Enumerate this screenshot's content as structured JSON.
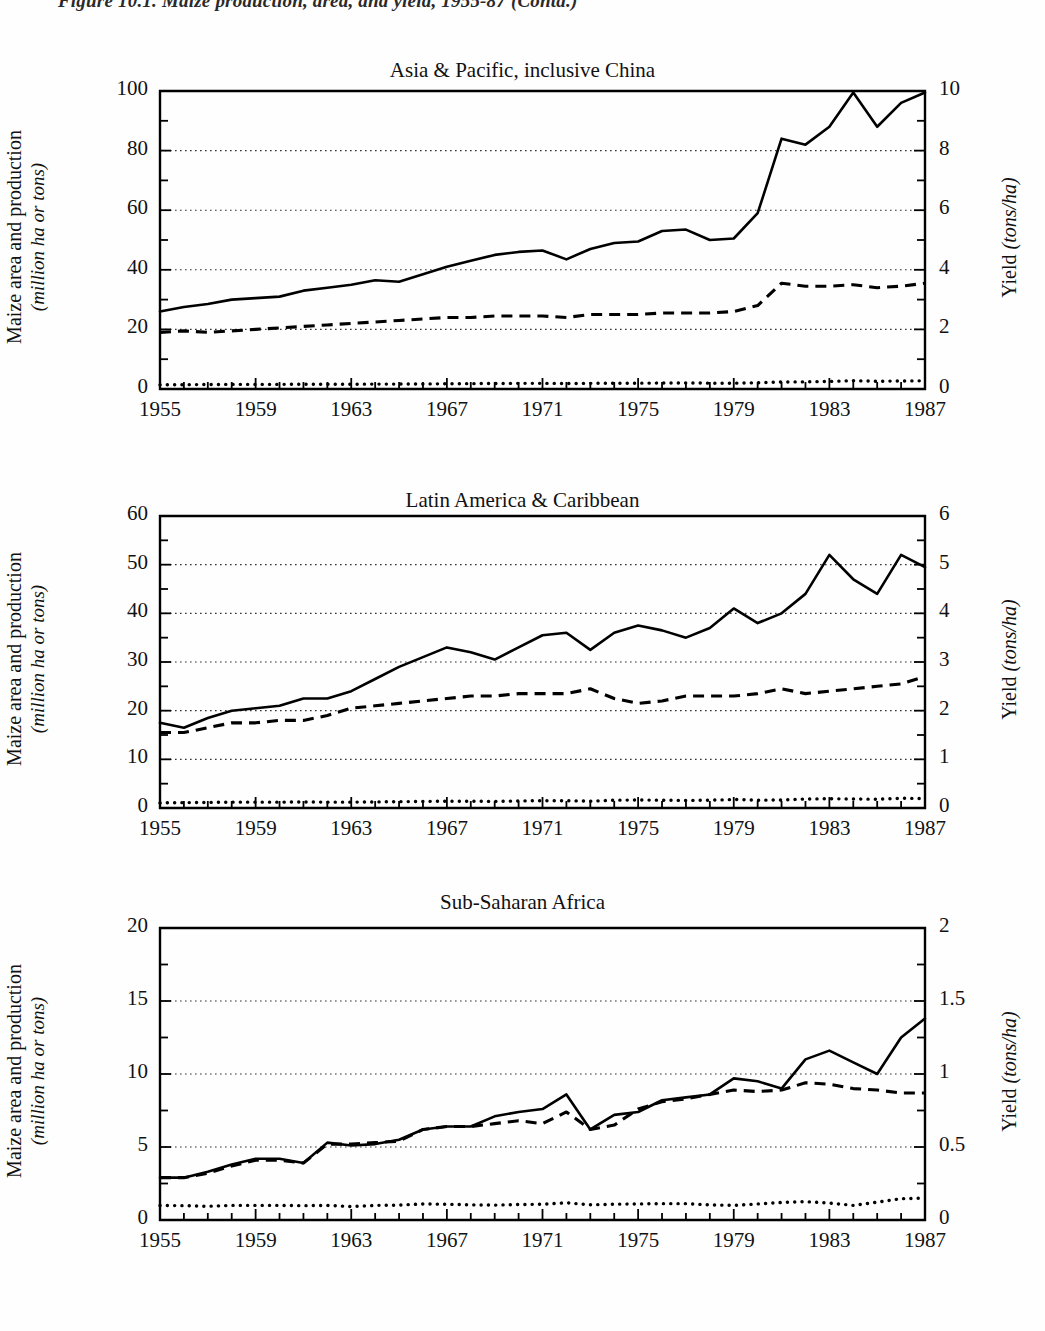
{
  "figure": {
    "caption": "Figure 10.1. Maize production, area, and yield, 1955-87 (Contd.)"
  },
  "axis_labels": {
    "left_line1": "Maize area and production",
    "left_line2": "(million ha or tons)",
    "right_main": "Yield ",
    "right_unit": "(tons/ha)"
  },
  "chart_data": [
    {
      "type": "line",
      "title": "Asia & Pacific, inclusive China",
      "xlabel": "",
      "ylabel": "Maize area and production (million ha or tons)",
      "ylabel_right": "Yield (tons/ha)",
      "grid": true,
      "legend": "none",
      "x": [
        1955,
        1956,
        1957,
        1958,
        1959,
        1960,
        1961,
        1962,
        1963,
        1964,
        1965,
        1966,
        1967,
        1968,
        1969,
        1970,
        1971,
        1972,
        1973,
        1974,
        1975,
        1976,
        1977,
        1978,
        1979,
        1980,
        1981,
        1982,
        1983,
        1984,
        1985,
        1986,
        1987
      ],
      "xlim": [
        1955,
        1987
      ],
      "xticks": [
        1955,
        1959,
        1963,
        1967,
        1971,
        1975,
        1979,
        1983,
        1987
      ],
      "ylim": [
        0,
        100
      ],
      "yticks": [
        0,
        20,
        40,
        60,
        80,
        100
      ],
      "yticks_minor": [
        10,
        30,
        50,
        70,
        90
      ],
      "ylim_right": [
        0,
        10
      ],
      "yticks_right": [
        0,
        2,
        4,
        6,
        8,
        10
      ],
      "series": [
        {
          "name": "Production (million tons)",
          "style": "solid",
          "values": [
            26,
            27.5,
            28.5,
            30,
            30.5,
            31,
            33,
            34,
            35,
            36.5,
            36,
            38.5,
            41,
            43,
            45,
            46,
            46.5,
            43.5,
            47,
            49,
            49.5,
            53,
            53.5,
            50,
            50.5,
            59,
            84,
            82,
            88,
            99.5,
            88,
            96,
            99.5
          ]
        },
        {
          "name": "Area (million ha)",
          "style": "dashed",
          "values": [
            19,
            19.5,
            19,
            19.5,
            20,
            20.5,
            21,
            21.5,
            22,
            22.5,
            23,
            23.5,
            24,
            24,
            24.5,
            24.5,
            24.5,
            24,
            25,
            25,
            25,
            25.5,
            25.5,
            25.5,
            26,
            28,
            35.5,
            34.5,
            34.5,
            35,
            34,
            34.5,
            35.5
          ]
        },
        {
          "name": "Yield (tons/ha)",
          "style": "dotted",
          "values": [
            1.4,
            1.45,
            1.5,
            1.55,
            1.55,
            1.55,
            1.6,
            1.6,
            1.6,
            1.65,
            1.65,
            1.7,
            1.75,
            1.8,
            1.85,
            1.9,
            1.9,
            1.85,
            1.9,
            1.95,
            1.95,
            2.0,
            2.05,
            1.95,
            1.95,
            2.1,
            2.35,
            2.4,
            2.55,
            2.8,
            2.6,
            2.7,
            2.75
          ]
        }
      ]
    },
    {
      "type": "line",
      "title": "Latin America & Caribbean",
      "xlabel": "",
      "ylabel": "Maize area and production (million ha or tons)",
      "ylabel_right": "Yield (tons/ha)",
      "grid": true,
      "legend": "none",
      "x": [
        1955,
        1956,
        1957,
        1958,
        1959,
        1960,
        1961,
        1962,
        1963,
        1964,
        1965,
        1966,
        1967,
        1968,
        1969,
        1970,
        1971,
        1972,
        1973,
        1974,
        1975,
        1976,
        1977,
        1978,
        1979,
        1980,
        1981,
        1982,
        1983,
        1984,
        1985,
        1986,
        1987
      ],
      "xlim": [
        1955,
        1987
      ],
      "xticks": [
        1955,
        1959,
        1963,
        1967,
        1971,
        1975,
        1979,
        1983,
        1987
      ],
      "ylim": [
        0,
        60
      ],
      "yticks": [
        0,
        10,
        20,
        30,
        40,
        50,
        60
      ],
      "yticks_minor": [
        5,
        15,
        25,
        35,
        45,
        55
      ],
      "ylim_right": [
        0,
        6
      ],
      "yticks_right": [
        0,
        1,
        2,
        3,
        4,
        5,
        6
      ],
      "series": [
        {
          "name": "Production (million tons)",
          "style": "solid",
          "values": [
            17.5,
            16.5,
            18.5,
            20,
            20.5,
            21,
            22.5,
            22.5,
            24,
            26.5,
            29,
            31,
            33,
            32,
            30.5,
            33,
            35.5,
            36,
            32.5,
            36,
            37.5,
            36.5,
            35,
            37,
            41,
            38,
            40,
            44,
            52,
            47,
            44,
            52,
            49.5,
            51.5
          ]
        },
        {
          "name": "Area (million ha)",
          "style": "dashed",
          "values": [
            15.5,
            15.5,
            16.5,
            17.5,
            17.5,
            18,
            18,
            19,
            20.5,
            21,
            21.5,
            22,
            22.5,
            23,
            23,
            23.5,
            23.5,
            23.5,
            24.5,
            22.5,
            21.5,
            22,
            23,
            23,
            23,
            23.5,
            24.5,
            23.5,
            24,
            24.5,
            25,
            25.5,
            27
          ]
        },
        {
          "name": "Yield (tons/ha)",
          "style": "dotted",
          "values": [
            1.05,
            1.1,
            1.15,
            1.2,
            1.2,
            1.2,
            1.25,
            1.2,
            1.2,
            1.25,
            1.3,
            1.35,
            1.4,
            1.4,
            1.35,
            1.45,
            1.5,
            1.5,
            1.4,
            1.6,
            1.65,
            1.6,
            1.55,
            1.6,
            1.75,
            1.6,
            1.65,
            1.85,
            1.9,
            1.85,
            1.8,
            2.0,
            1.95,
            2.75
          ]
        }
      ]
    },
    {
      "type": "line",
      "title": "Sub-Saharan Africa",
      "xlabel": "",
      "ylabel": "Maize area and production (million ha or tons)",
      "ylabel_right": "Yield (tons/ha)",
      "grid": true,
      "legend": "none",
      "x": [
        1955,
        1956,
        1957,
        1958,
        1959,
        1960,
        1961,
        1962,
        1963,
        1964,
        1965,
        1966,
        1967,
        1968,
        1969,
        1970,
        1971,
        1972,
        1973,
        1974,
        1975,
        1976,
        1977,
        1978,
        1979,
        1980,
        1981,
        1982,
        1983,
        1984,
        1985,
        1986,
        1987
      ],
      "xlim": [
        1955,
        1987
      ],
      "xticks": [
        1955,
        1959,
        1963,
        1967,
        1971,
        1975,
        1979,
        1983,
        1987
      ],
      "ylim": [
        0,
        20
      ],
      "yticks": [
        0,
        5,
        10,
        15,
        20
      ],
      "yticks_minor": [
        2.5,
        7.5,
        12.5,
        17.5
      ],
      "ylim_right": [
        0,
        2
      ],
      "yticks_right": [
        0,
        0.5,
        1,
        1.5,
        2
      ],
      "series": [
        {
          "name": "Production (million tons)",
          "style": "solid",
          "values": [
            2.9,
            2.9,
            3.3,
            3.8,
            4.2,
            4.2,
            3.9,
            5.3,
            5.1,
            5.2,
            5.5,
            6.2,
            6.4,
            6.4,
            7.1,
            7.4,
            7.6,
            8.6,
            6.2,
            7.2,
            7.4,
            8.2,
            8.4,
            8.6,
            9.7,
            9.5,
            9.0,
            11.0,
            11.6,
            10.8,
            10.0,
            12.5,
            13.8,
            11.0
          ]
        },
        {
          "name": "Area (million ha)",
          "style": "dashed",
          "values": [
            2.9,
            2.9,
            3.2,
            3.7,
            4.1,
            4.1,
            3.9,
            5.2,
            5.2,
            5.3,
            5.4,
            6.2,
            6.4,
            6.4,
            6.6,
            6.8,
            6.6,
            7.4,
            6.2,
            6.5,
            7.6,
            8.1,
            8.3,
            8.6,
            8.9,
            8.8,
            8.9,
            9.4,
            9.3,
            9.0,
            8.9,
            8.7,
            8.7
          ]
        },
        {
          "name": "Yield (tons/ha)",
          "style": "dotted",
          "values": [
            1.0,
            0.98,
            0.94,
            1.0,
            1.0,
            1.0,
            0.98,
            1.0,
            0.92,
            1.0,
            1.02,
            1.1,
            1.08,
            1.04,
            1.02,
            1.06,
            1.08,
            1.18,
            1.04,
            1.08,
            1.1,
            1.12,
            1.12,
            1.04,
            1.0,
            1.1,
            1.2,
            1.26,
            1.16,
            1.0,
            1.22,
            1.46,
            1.5,
            1.22
          ]
        }
      ]
    }
  ]
}
